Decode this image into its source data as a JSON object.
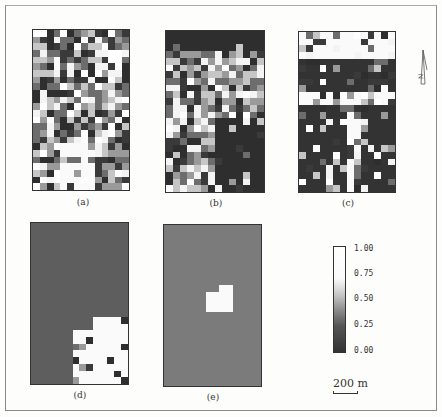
{
  "figure": {
    "panels": [
      {
        "id": "a",
        "label": "(a)",
        "x": 32,
        "y": 29,
        "w": 98,
        "h": 162,
        "label_x": 63,
        "label_y": 197
      },
      {
        "id": "b",
        "label": "(b)",
        "x": 165,
        "y": 30,
        "w": 100,
        "h": 163,
        "label_x": 196,
        "label_y": 198
      },
      {
        "id": "c",
        "label": "(c)",
        "x": 298,
        "y": 31,
        "w": 98,
        "h": 162,
        "label_x": 328,
        "label_y": 198
      },
      {
        "id": "d",
        "label": "(d)",
        "x": 30,
        "y": 222,
        "w": 99,
        "h": 163,
        "label_x": 60,
        "label_y": 390
      },
      {
        "id": "e",
        "label": "(e)",
        "x": 163,
        "y": 224,
        "w": 99,
        "h": 163,
        "label_x": 193,
        "label_y": 392
      }
    ],
    "colorbar": {
      "ticks": [
        "1.00",
        "0.75",
        "0.50",
        "0.25",
        "0.00"
      ],
      "tick_y": [
        244,
        269,
        294,
        320,
        346
      ]
    },
    "scale_bar": {
      "label": "200 m"
    },
    "north_arrow": {
      "label": "N"
    }
  }
}
